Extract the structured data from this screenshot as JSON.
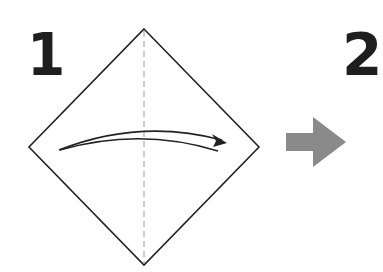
{
  "steps": [
    {
      "number": "1"
    },
    {
      "number": "2"
    }
  ],
  "diagram": {
    "paper_shape": "square-diamond",
    "vertices": {
      "top": [
        144,
        29
      ],
      "right": [
        259,
        147
      ],
      "bottom": [
        144,
        265
      ],
      "left": [
        29,
        147
      ]
    },
    "crease": {
      "style": "dashed-valley",
      "orientation": "vertical"
    },
    "fold_arrow": {
      "direction": "left-to-right"
    },
    "next_step_arrow": {
      "color": "#8a8a8a",
      "direction": "right"
    }
  },
  "colors": {
    "line": "#222222",
    "crease": "#9a9a9a",
    "number": "#1e1e1e",
    "gray_arrow": "#8a8a8a"
  }
}
